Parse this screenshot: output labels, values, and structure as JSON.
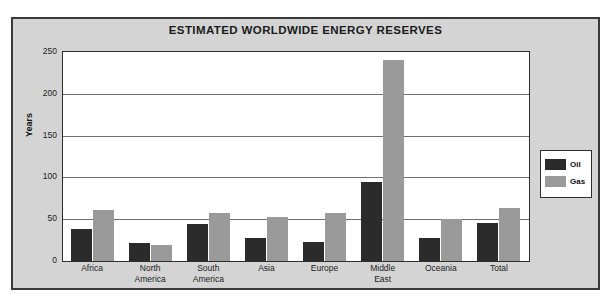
{
  "chart_data": {
    "type": "bar",
    "title": "ESTIMATED WORLDWIDE ENERGY RESERVES",
    "xlabel": "",
    "ylabel": "Years",
    "ylim": [
      0,
      250
    ],
    "yticks": [
      0,
      50,
      100,
      150,
      200,
      250
    ],
    "grid": true,
    "legend_position": "right",
    "categories": [
      "Africa",
      "North America",
      "South America",
      "Asia",
      "Europe",
      "Middle East",
      "Oceania",
      "Total"
    ],
    "category_lines": [
      [
        "Africa"
      ],
      [
        "North",
        "America"
      ],
      [
        "South",
        "America"
      ],
      [
        "Asia"
      ],
      [
        "Europe"
      ],
      [
        "Middle",
        "East"
      ],
      [
        "Oceania"
      ],
      [
        "Total"
      ]
    ],
    "series": [
      {
        "name": "Oil",
        "color": "#2b2b2b",
        "values": [
          38,
          22,
          44,
          28,
          23,
          95,
          28,
          45
        ]
      },
      {
        "name": "Gas",
        "color": "#9a9a9a",
        "values": [
          61,
          19,
          57,
          53,
          58,
          240,
          50,
          64
        ]
      }
    ]
  },
  "legend": {
    "items": [
      {
        "label": "Oil",
        "swatch": "oil"
      },
      {
        "label": "Gas",
        "swatch": "gas"
      }
    ]
  },
  "colors": {
    "panel_background": "#d4d4d4",
    "plot_background": "#ffffff",
    "frame": "#3a3a3a",
    "gridline": "#6f6f6f",
    "oil": "#2b2b2b",
    "gas": "#9a9a9a"
  }
}
